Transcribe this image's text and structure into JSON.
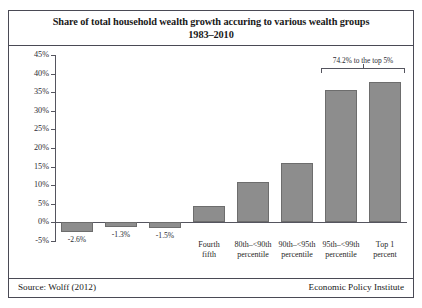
{
  "title": {
    "line1": "Share of total household wealth growth accuring to various wealth groups",
    "line2": "1983–2010"
  },
  "footer": {
    "source": "Source: Wolff (2012)",
    "attribution": "Economic Policy Institute"
  },
  "annotation": {
    "text": "74.2% to the top 5%"
  },
  "colors": {
    "bar_fill": "#8d8d8d",
    "bar_stroke": "#6d6d6d",
    "axis": "#55555f",
    "frame": "#4a4a55"
  },
  "chart_data": {
    "type": "bar",
    "title": "Share of total household wealth growth accuring to various wealth groups 1983–2010",
    "subtitle": "1983–2010",
    "xlabel": "",
    "ylabel": "",
    "ylim": [
      -5,
      45
    ],
    "ytick_step": 5,
    "grid": false,
    "legend": null,
    "ytick_labels": [
      "45%",
      "40%",
      "35%",
      "30%",
      "25%",
      "20%",
      "15%",
      "10%",
      "5%",
      "0%",
      "-5%"
    ],
    "categories": [
      "",
      "",
      "",
      "Fourth fifth",
      "80th–<90th percentile",
      "90th–<95th percentile",
      "95th–<99th percentile",
      "Top 1 percent"
    ],
    "category_lines": [
      [
        "",
        ""
      ],
      [
        "",
        ""
      ],
      [
        "",
        ""
      ],
      [
        "Fourth",
        "fifth"
      ],
      [
        "80th–<90th",
        "percentile"
      ],
      [
        "90th–<95th",
        "percentile"
      ],
      [
        "95th–<99th",
        "percentile"
      ],
      [
        "Top 1",
        "percent"
      ]
    ],
    "values": [
      -2.6,
      -1.3,
      -1.5,
      4.3,
      10.8,
      16.0,
      35.6,
      37.8
    ],
    "value_labels": [
      "-2.6%",
      "-1.3%",
      "-1.5%",
      "",
      "",
      "",
      "",
      ""
    ],
    "annotations": [
      {
        "text": "74.2% to the top 5%",
        "spans_categories": [
          "95th–<99th percentile",
          "Top 1 percent"
        ],
        "value": 74.2
      }
    ]
  }
}
